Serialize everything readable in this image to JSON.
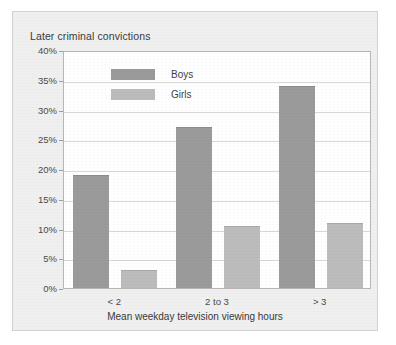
{
  "chart_data": {
    "type": "bar",
    "title": "Later criminal convictions",
    "xlabel": "Mean weekday television viewing hours",
    "ylabel": "",
    "categories": [
      "< 2",
      "2 to 3",
      "> 3"
    ],
    "series": [
      {
        "name": "Boys",
        "values": [
          19,
          27,
          34
        ],
        "color": "#9b9b9b"
      },
      {
        "name": "Girls",
        "values": [
          3,
          10.5,
          11
        ],
        "color": "#bcbcbc"
      }
    ],
    "ylim": [
      0,
      40
    ],
    "ytick_step": 5,
    "ytick_labels": [
      "0%",
      "5%",
      "10%",
      "15%",
      "20%",
      "25%",
      "30%",
      "35%",
      "40%"
    ],
    "grid": true,
    "legend_position": "inside-top-left"
  },
  "legend": {
    "boys_label": "Boys",
    "girls_label": "Girls"
  }
}
